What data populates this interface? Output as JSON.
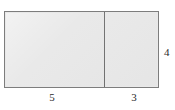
{
  "figure": {
    "type": "composite-rectangle-diagram",
    "fill_color": "#e8e8e8",
    "outline_color": "#7d7d7d",
    "divider_color": "#6f6f6f",
    "label_color": "#2b2b2b"
  },
  "regions": [
    {
      "name": "left-rectangle",
      "width_label": "5",
      "height_label": "4"
    },
    {
      "name": "right-rectangle",
      "width_label": "3",
      "height_label": "4"
    }
  ],
  "labels": {
    "bottom_left": "5",
    "bottom_right": "3",
    "right_side": "4"
  },
  "chart_data": {
    "type": "diagram",
    "title": "",
    "shapes": [
      {
        "shape": "rectangle",
        "id": "left-rectangle",
        "width": 5,
        "height": 4,
        "area": 20,
        "fill": "#e8e8e8"
      },
      {
        "shape": "rectangle",
        "id": "right-rectangle",
        "width": 3,
        "height": 4,
        "area": 12,
        "fill": "#e8e8e8"
      }
    ],
    "total_width": 8,
    "total_height": 4,
    "total_area": 32,
    "annotations": [
      {
        "text": "5",
        "position": "bottom",
        "refers_to": "left-rectangle"
      },
      {
        "text": "3",
        "position": "bottom",
        "refers_to": "right-rectangle"
      },
      {
        "text": "4",
        "position": "right",
        "refers_to": "overall-height"
      }
    ]
  }
}
